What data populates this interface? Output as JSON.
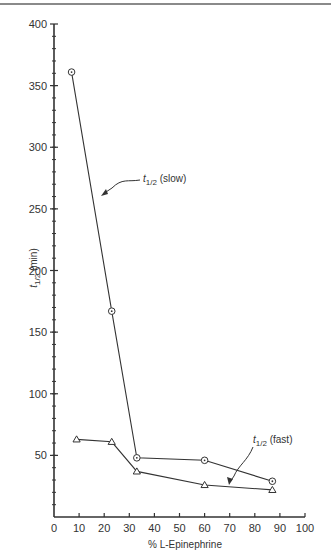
{
  "chart_data": {
    "type": "line",
    "title": "",
    "xlabel": "% L-Epinephrine",
    "ylabel": "t1/2 (min)",
    "ylabel_parts": {
      "symbol": "t",
      "subscript": "1/2",
      "unit": "(min)"
    },
    "xlim": [
      0,
      100
    ],
    "ylim": [
      0,
      400
    ],
    "x_ticks": [
      0,
      10,
      20,
      30,
      40,
      50,
      60,
      70,
      80,
      90,
      100
    ],
    "y_ticks": [
      50,
      100,
      150,
      200,
      250,
      300,
      350,
      400
    ],
    "y_minor_step": 10,
    "grid": false,
    "legend": "none (inline annotations)",
    "series": [
      {
        "name": "t1/2 (slow)",
        "label_symbol": "t",
        "label_subscript": "1/2",
        "label_suffix": "(slow)",
        "marker": "circle-dot",
        "x": [
          7,
          23,
          33,
          60,
          87
        ],
        "y": [
          361,
          167,
          48,
          46,
          29
        ]
      },
      {
        "name": "t1/2 (fast)",
        "label_symbol": "t",
        "label_subscript": "1/2",
        "label_suffix": "(fast)",
        "marker": "triangle",
        "x": [
          9,
          23,
          33,
          60,
          87
        ],
        "y": [
          63,
          61,
          37,
          26,
          22
        ]
      }
    ]
  },
  "colors": {
    "line": "#333333",
    "background": "#ffffff",
    "topline": "#8a8a8a"
  }
}
